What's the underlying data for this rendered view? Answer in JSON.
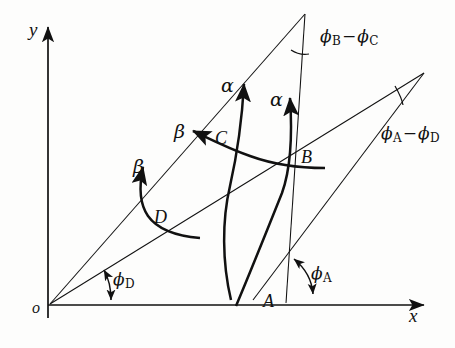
{
  "figure": {
    "type": "technical-diagram",
    "background_color": "#fdfdfc",
    "ink_color": "#111111"
  },
  "axes": {
    "y_label": "y",
    "x_label": "x",
    "origin_label": "o"
  },
  "points": [
    {
      "id": "A",
      "label": "A"
    },
    {
      "id": "B",
      "label": "B"
    },
    {
      "id": "C",
      "label": "C"
    },
    {
      "id": "D",
      "label": "D"
    }
  ],
  "curve_labels": [
    {
      "id": "alpha-left",
      "label": "α"
    },
    {
      "id": "alpha-right",
      "label": "α"
    },
    {
      "id": "beta-upper",
      "label": "β"
    },
    {
      "id": "beta-lower",
      "label": "β"
    }
  ],
  "angles": [
    {
      "id": "phi-A",
      "phi": "ϕ",
      "subscript": "A",
      "text": "ϕA"
    },
    {
      "id": "phi-D",
      "phi": "ϕ",
      "subscript": "D",
      "text": "ϕD"
    },
    {
      "id": "phi-B-minus-phi-C",
      "phi1": "ϕ",
      "sub1": "B",
      "minus": "−",
      "phi2": "ϕ",
      "sub2": "C",
      "text": "ϕB − ϕC"
    },
    {
      "id": "phi-A-minus-phi-D",
      "phi1": "ϕ",
      "sub1": "A",
      "minus": "−",
      "phi2": "ϕ",
      "sub2": "D",
      "text": "ϕA − ϕD"
    }
  ]
}
